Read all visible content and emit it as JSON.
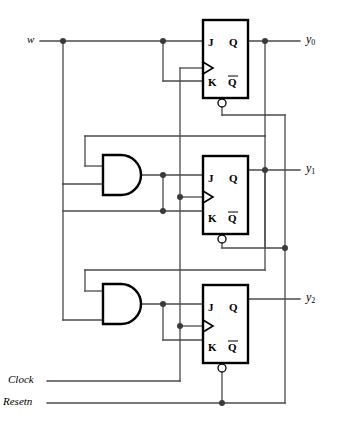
{
  "diagram": {
    "wire_color": "#4a4a4a",
    "gate_color": "#000000",
    "inputs": [
      {
        "name": "w-input-label",
        "text": "w",
        "x": 27,
        "y": 34
      },
      {
        "name": "clock-input-label",
        "text": "Clock",
        "x": 8,
        "y": 373
      },
      {
        "name": "resetn-input-label",
        "text": "Resetn",
        "x": 3,
        "y": 395
      }
    ],
    "outputs": [
      {
        "name": "y0-output-label",
        "text": "y",
        "sub": "0",
        "x": 306,
        "y": 33
      },
      {
        "name": "y1-output-label",
        "text": "y",
        "sub": "1",
        "x": 306,
        "y": 168
      },
      {
        "name": "y2-output-label",
        "text": "y",
        "sub": "2",
        "x": 306,
        "y": 297
      }
    ],
    "flipflops": [
      {
        "name": "jk-flipflop-0",
        "box": {
          "x": 203,
          "y": 20,
          "w": 45,
          "h": 78
        },
        "pins": {
          "j": "J",
          "q": "Q",
          "k": "K",
          "qbar": "Q"
        },
        "j_label_pos": {
          "x": 208,
          "y": 35
        },
        "q_label_pos": {
          "x": 233,
          "y": 35
        },
        "k_label_pos": {
          "x": 208,
          "y": 75
        },
        "qbar_label_pos": {
          "x": 233,
          "y": 75
        },
        "clock_y": 68,
        "reset_bubble": {
          "x": 222,
          "y": 101
        }
      },
      {
        "name": "jk-flipflop-1",
        "box": {
          "x": 203,
          "y": 156,
          "w": 45,
          "h": 78
        },
        "pins": {
          "j": "J",
          "q": "Q",
          "k": "K",
          "qbar": "Q"
        },
        "j_label_pos": {
          "x": 208,
          "y": 171
        },
        "q_label_pos": {
          "x": 233,
          "y": 171
        },
        "k_label_pos": {
          "x": 208,
          "y": 211
        },
        "qbar_label_pos": {
          "x": 233,
          "y": 211
        },
        "clock_y": 197,
        "reset_bubble": {
          "x": 222,
          "y": 237
        }
      },
      {
        "name": "jk-flipflop-2",
        "box": {
          "x": 203,
          "y": 285,
          "w": 45,
          "h": 78
        },
        "pins": {
          "j": "J",
          "q": "Q",
          "k": "K",
          "qbar": "Q"
        },
        "j_label_pos": {
          "x": 208,
          "y": 300
        },
        "q_label_pos": {
          "x": 233,
          "y": 300
        },
        "k_label_pos": {
          "x": 208,
          "y": 340
        },
        "qbar_label_pos": {
          "x": 233,
          "y": 340
        },
        "clock_y": 326,
        "reset_bubble": {
          "x": 222,
          "y": 366
        }
      }
    ],
    "and_gates": [
      {
        "name": "and-gate-1",
        "x": 103,
        "y": 155,
        "w": 37,
        "h": 40,
        "out_y": 175
      },
      {
        "name": "and-gate-2",
        "x": 103,
        "y": 284,
        "w": 37,
        "h": 40,
        "out_y": 304
      }
    ],
    "junction_dots": [
      {
        "name": "dot-w-branch",
        "x": 63,
        "y": 41
      },
      {
        "name": "dot-w-to-k0",
        "x": 163,
        "y": 41
      },
      {
        "name": "dot-q0-out",
        "x": 265,
        "y": 41
      },
      {
        "name": "dot-and1-out",
        "x": 163,
        "y": 175
      },
      {
        "name": "dot-clock-ff1",
        "x": 180,
        "y": 197
      },
      {
        "name": "dot-k1-line",
        "x": 163,
        "y": 211
      },
      {
        "name": "dot-q1-out",
        "x": 265,
        "y": 170
      },
      {
        "name": "dot-q1-feedback",
        "x": 285,
        "y": 248
      },
      {
        "name": "dot-and2-out",
        "x": 163,
        "y": 304
      },
      {
        "name": "dot-clock-ff2",
        "x": 180,
        "y": 326
      },
      {
        "name": "dot-resetn-bus",
        "x": 222,
        "y": 403
      }
    ]
  }
}
